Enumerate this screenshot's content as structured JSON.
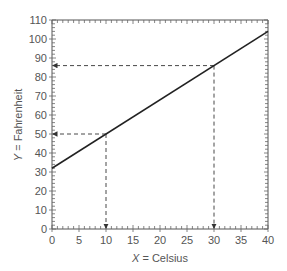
{
  "chart_data": {
    "type": "line",
    "title": "",
    "xlabel_var": "X",
    "xlabel_text": " = Celsius",
    "ylabel_var": "Y",
    "ylabel_text": " = Fahrenheit",
    "xlim": [
      0,
      40
    ],
    "ylim": [
      0,
      110
    ],
    "x_ticks": [
      0,
      5,
      10,
      15,
      20,
      25,
      30,
      35,
      40
    ],
    "y_ticks": [
      0,
      10,
      20,
      30,
      40,
      50,
      60,
      70,
      80,
      90,
      100,
      110
    ],
    "minor_x_step": 1,
    "minor_y_step": 2,
    "grid": false,
    "series": [
      {
        "name": "F = 1.8C + 32",
        "x": [
          0,
          40
        ],
        "y": [
          32,
          104
        ],
        "color": "#222222"
      }
    ],
    "annotations": [
      {
        "type": "dashed-arrow-guide",
        "x": 10,
        "y": 50
      },
      {
        "type": "dashed-arrow-guide",
        "x": 30,
        "y": 86
      }
    ]
  }
}
